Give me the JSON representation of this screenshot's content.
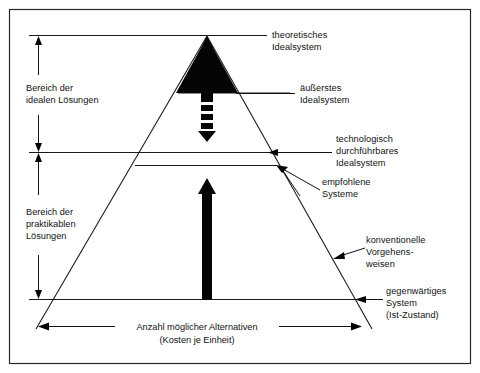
{
  "figure": {
    "background_color": "#ffffff",
    "ink_color": "#111111",
    "frame_color": "#2b2b2b"
  },
  "brackets": {
    "upper": {
      "line1": "Bereich der",
      "line2": "idealen Lösungen"
    },
    "lower": {
      "line1": "Bereich der",
      "line2": "praktikablen",
      "line3": "Lösungen"
    }
  },
  "right_labels": {
    "theoretical": {
      "line1": "theoretisches",
      "line2": "Idealsystem"
    },
    "outermost": {
      "line1": "äußerstes",
      "line2": "Idealsystem"
    },
    "technological": {
      "line1": "technologisch",
      "line2": "durchführbares",
      "line3": "Idealsystem"
    },
    "recommended": {
      "line1": "empfohlene",
      "line2": "Systeme"
    },
    "conventional": {
      "line1": "konventionelle",
      "line2": "Vorgehens-",
      "line3": "weisen"
    },
    "current": {
      "line1": "gegenwärtiges",
      "line2": "System",
      "line3": "(Ist-Zustand)"
    }
  },
  "axis": {
    "line1": "Anzahl möglicher Alternativen",
    "line2": "(Kosten je Einheit)"
  }
}
